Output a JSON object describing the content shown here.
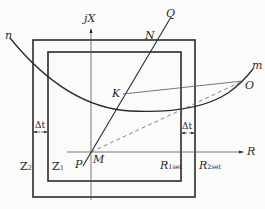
{
  "diagram": {
    "type": "impedance-plane protection characteristic",
    "axes": {
      "x_label": "R",
      "y_label_prefix": "j",
      "y_label": "X"
    },
    "zones": {
      "inner": {
        "label_main": "Z",
        "label_sub": "1"
      },
      "outer": {
        "label_main": "Z",
        "label_sub": "2"
      }
    },
    "settings": {
      "r1": {
        "label_main": "R",
        "label_sub": "1set"
      },
      "r2": {
        "label_main": "R",
        "label_sub": "2set"
      }
    },
    "gap": {
      "left": "Δt",
      "right": "Δt"
    },
    "points": {
      "n": "n",
      "m": "m",
      "Q": "Q",
      "N": "N",
      "K": "K",
      "O": "O",
      "M": "M",
      "P": "P"
    },
    "colors": {
      "line": "#2a2a2a",
      "thin": "#555555",
      "background": "#fbfbfa"
    }
  }
}
